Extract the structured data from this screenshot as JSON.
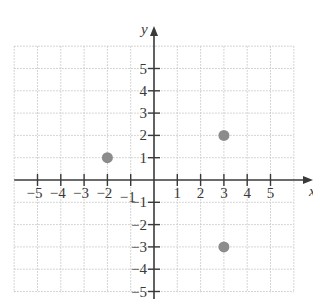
{
  "chart_data": {
    "type": "scatter",
    "title": "",
    "xlabel": "x",
    "ylabel": "y",
    "xlim": [
      -6,
      6
    ],
    "ylim": [
      -5,
      6
    ],
    "grid": true,
    "legend": null,
    "x_ticks": [
      -5,
      -4,
      -3,
      -2,
      -1,
      1,
      2,
      3,
      4,
      5
    ],
    "y_ticks": [
      -5,
      -4,
      -3,
      -2,
      -1,
      1,
      2,
      3,
      4,
      5
    ],
    "x_tick_labels": [
      "−5",
      "−4",
      "−3",
      "−2",
      "−1",
      "1",
      "2",
      "3",
      "4",
      "5"
    ],
    "y_tick_labels": [
      "−5",
      "−4",
      "−3",
      "−2",
      "−1",
      "1",
      "2",
      "3",
      "4",
      "5"
    ],
    "series": [
      {
        "name": "points",
        "points": [
          {
            "x": -2,
            "y": 1
          },
          {
            "x": 3,
            "y": 2
          },
          {
            "x": 3,
            "y": -3
          }
        ]
      }
    ]
  },
  "colors": {
    "axis": "#3a3a3a",
    "grid": "#c8c8c8",
    "point": "#8c8c8c",
    "background": "#ffffff"
  },
  "layout": {
    "origin_px": [
      154,
      180
    ],
    "unit_x_px": 23.3,
    "unit_y_px": 22.3,
    "grid_x_range": [
      -6,
      6
    ],
    "grid_y_range": [
      -5,
      6
    ],
    "point_radius": 5.5
  }
}
